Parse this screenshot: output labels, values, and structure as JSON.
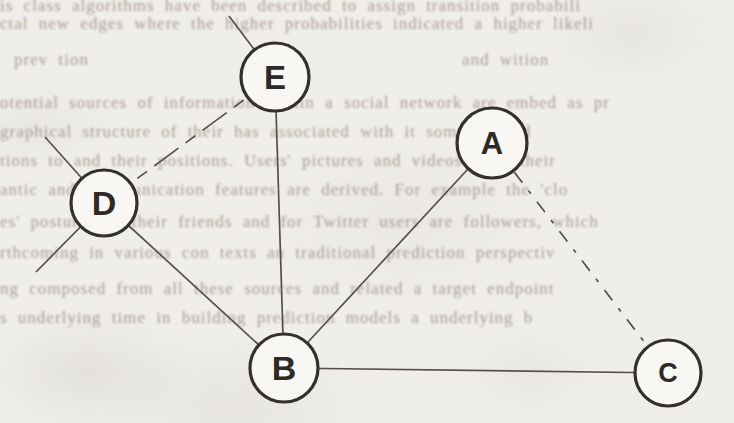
{
  "figure_type": "network-graph-scan",
  "graph": {
    "nodes": [
      {
        "id": "E",
        "label": "E",
        "x": 275,
        "y": 77,
        "r": 34,
        "label_size": 33
      },
      {
        "id": "A",
        "label": "A",
        "x": 492,
        "y": 143,
        "r": 35,
        "label_size": 31
      },
      {
        "id": "D",
        "label": "D",
        "x": 104,
        "y": 203,
        "r": 33,
        "label_size": 34
      },
      {
        "id": "B",
        "label": "B",
        "x": 284,
        "y": 368,
        "r": 34,
        "label_size": 34
      },
      {
        "id": "C",
        "label": "C",
        "x": 668,
        "y": 373,
        "r": 33,
        "label_size": 27
      }
    ],
    "edges": [
      {
        "from": "E",
        "to": "B",
        "style": "solid"
      },
      {
        "from": "D",
        "to": "B",
        "style": "solid"
      },
      {
        "from": "A",
        "to": "B",
        "style": "solid"
      },
      {
        "from": "B",
        "to": "C",
        "style": "solid"
      },
      {
        "from": "E",
        "to": "D",
        "style": "dashed",
        "dash": "30 9 12 9"
      },
      {
        "from": "A",
        "to": "C",
        "style": "dashed",
        "dash": "13 10 4 10"
      }
    ],
    "stub_edges": [
      {
        "from": "E",
        "x2": 229,
        "y2": 16
      },
      {
        "from": "D",
        "x2": 45,
        "y2": 137
      },
      {
        "from": "D",
        "x2": 36,
        "y2": 272
      }
    ],
    "colors": {
      "background": "#f0eeea",
      "node_fill": "#f8f7f3",
      "node_stroke": "#34312c",
      "edge": "#55514a",
      "label": "#2e2b26",
      "bleed_text": "#988f81"
    }
  },
  "bleed": {
    "lines": [
      {
        "x": 0,
        "y": -4,
        "text": "is class algorithms have been described to assign transition probabili"
      },
      {
        "x": 0,
        "y": 14,
        "text": "ctal new edges where the higher probabilities indicated a higher likeli"
      },
      {
        "x": 14,
        "y": 50,
        "text": "prev tion"
      },
      {
        "x": 462,
        "y": 50,
        "text": "and wition"
      },
      {
        "x": 0,
        "y": 93,
        "text": "otential sources of information within a social network are embed as pr"
      },
      {
        "x": 0,
        "y": 122,
        "text": "graphical structure of their has associated with it some limited"
      },
      {
        "x": 0,
        "y": 151,
        "text": "tions to and their positions. Users' pictures and videos from their"
      },
      {
        "x": 0,
        "y": 180,
        "text": "antic and communication features are derived. For example the 'clo"
      },
      {
        "x": 0,
        "y": 212,
        "text": "es' postures of their friends and for Twitter users are followers, which"
      },
      {
        "x": 0,
        "y": 243,
        "text": "rthcoming in various con texts an traditional prediction perspectiv"
      },
      {
        "x": 0,
        "y": 279,
        "text": "ng composed from all these sources and related a target endpoint"
      },
      {
        "x": 0,
        "y": 308,
        "text": "s underlying time in building prediction models a underlying b"
      }
    ]
  }
}
